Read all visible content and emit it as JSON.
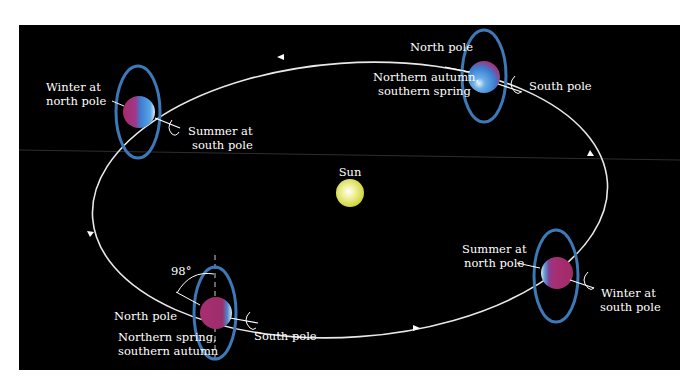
{
  "diagram": {
    "colors": {
      "background": "#000000",
      "page": "#ffffff",
      "orbit": "#e8e8e8",
      "ring": "#3d78b8",
      "planet_blue": "#3a86d6",
      "planet_magenta": "#b0306f",
      "sun": "#e4e66a"
    },
    "sun": {
      "label": "Sun"
    },
    "positions": [
      {
        "id": "left",
        "season_label_line1": "Winter at",
        "season_label_line2": "north pole",
        "opposite_label_line1": "Summer at",
        "opposite_label_line2": "south pole"
      },
      {
        "id": "top-right",
        "north_label": "North pole",
        "season_label_line1": "Northern autumn,",
        "season_label_line2": "southern spring",
        "south_label": "South pole"
      },
      {
        "id": "right",
        "season_label_line1": "Summer at",
        "season_label_line2": "north pole",
        "opposite_label_line1": "Winter at",
        "opposite_label_line2": "south pole"
      },
      {
        "id": "bottom-left",
        "angle_label": "98°",
        "north_label": "North pole",
        "season_label_line1": "Northern spring,",
        "season_label_line2": "southern autumn",
        "south_label": "South pole"
      }
    ],
    "orbit_direction": "counterclockwise"
  }
}
